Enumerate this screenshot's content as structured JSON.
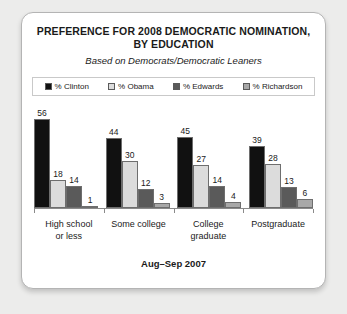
{
  "chart_data": {
    "type": "bar",
    "title": "PREFERENCE FOR 2008 DEMOCRATIC NOMINATION, BY EDUCATION",
    "title_line1": "PREFERENCE FOR 2008 DEMOCRATIC NOMINATION,",
    "title_line2": "BY EDUCATION",
    "subtitle": "Based on Democrats/Democratic Leaners",
    "footnote": "Aug–Sep 2007",
    "categories": [
      "High school or less",
      "Some college",
      "College graduate",
      "Postgraduate"
    ],
    "category_lines": [
      [
        "High school",
        "or less"
      ],
      [
        "Some college"
      ],
      [
        "College",
        "graduate"
      ],
      [
        "Postgraduate"
      ]
    ],
    "series": [
      {
        "name": "% Clinton",
        "color": "#111111",
        "values": [
          56,
          44,
          45,
          39
        ]
      },
      {
        "name": "% Obama",
        "color": "#dcdcdc",
        "values": [
          18,
          30,
          27,
          28
        ]
      },
      {
        "name": "% Edwards",
        "color": "#5a5a5a",
        "values": [
          14,
          12,
          14,
          13
        ]
      },
      {
        "name": "% Richardson",
        "color": "#a8a8a8",
        "values": [
          1,
          3,
          4,
          6
        ]
      }
    ],
    "xlabel": "",
    "ylabel": "",
    "ylim": [
      0,
      62
    ],
    "grid": false,
    "legend_position": "top"
  }
}
